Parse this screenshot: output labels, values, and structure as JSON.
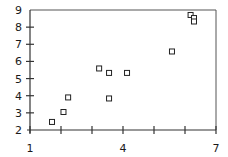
{
  "chart_data": {
    "type": "scatter",
    "title": "",
    "xlabel": "",
    "ylabel": "",
    "xlim": [
      1,
      7
    ],
    "ylim": [
      2,
      9
    ],
    "x_ticks": [
      1,
      2,
      3,
      4,
      5,
      6,
      7
    ],
    "x_tick_labels": [
      "1",
      "",
      "",
      "4",
      "",
      "",
      "7"
    ],
    "y_ticks": [
      2,
      3,
      4,
      5,
      6,
      7,
      8,
      9
    ],
    "y_tick_labels": [
      "2",
      "3",
      "4",
      "5",
      "6",
      "7",
      "8",
      "9"
    ],
    "grid": false,
    "legend": null,
    "marker": "open-square",
    "series": [
      {
        "name": "",
        "points": [
          {
            "x": 1.71,
            "y": 2.47
          },
          {
            "x": 2.08,
            "y": 3.05
          },
          {
            "x": 2.23,
            "y": 3.9
          },
          {
            "x": 3.23,
            "y": 5.59
          },
          {
            "x": 3.55,
            "y": 5.33
          },
          {
            "x": 4.13,
            "y": 5.33
          },
          {
            "x": 3.55,
            "y": 3.84
          },
          {
            "x": 5.58,
            "y": 6.58
          },
          {
            "x": 6.18,
            "y": 8.71
          },
          {
            "x": 6.29,
            "y": 8.53
          },
          {
            "x": 6.29,
            "y": 8.33
          }
        ]
      }
    ]
  },
  "colors": {
    "axis": "#333333",
    "marker_stroke": "#222222",
    "background": "#ffffff"
  }
}
